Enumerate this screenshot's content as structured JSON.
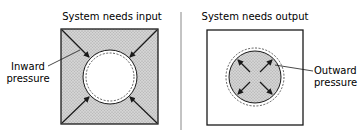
{
  "diagram": {
    "left_panel": {
      "title": "System needs input",
      "label_line1": "Inward",
      "label_line2": "pressure",
      "fill_color": "#c8c8c8",
      "arrow_direction": "inward"
    },
    "right_panel": {
      "title": "System needs output",
      "label_line1": "Outward",
      "label_line2": "pressure",
      "fill_color": "#c8c8c8",
      "arrow_direction": "outward"
    },
    "divider_color": "#888888",
    "stroke_color": "#1a1a1a"
  }
}
